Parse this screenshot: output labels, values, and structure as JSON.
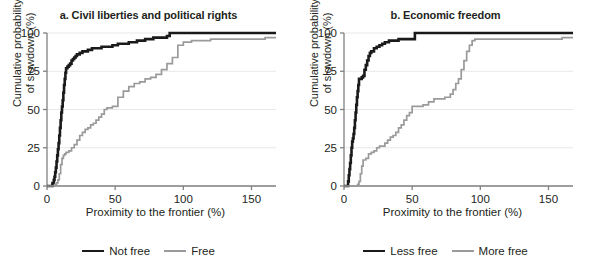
{
  "figure": {
    "width": 594,
    "height": 265,
    "background": "#ffffff"
  },
  "colors": {
    "dark_series": "#1a1a1a",
    "light_series": "#9a9a9a",
    "axis": "#808080",
    "grid": "#e8e8e8",
    "text": "#231f20"
  },
  "panels": [
    {
      "id": "panel-a",
      "title": "a. Civil liberties and political rights",
      "xlabel": "Proximity to the frontier (%)",
      "ylabel_line1": "Cumulative probability",
      "ylabel_line2": "of slowdown (%)",
      "legend": [
        {
          "label": "Not free",
          "color": "#1a1a1a",
          "style": "dark"
        },
        {
          "label": "Free",
          "color": "#9a9a9a",
          "style": "gray"
        }
      ]
    },
    {
      "id": "panel-b",
      "title": "b. Economic freedom",
      "xlabel": "Proximity to the frontier (%)",
      "ylabel_line1": "Cumulative probability",
      "ylabel_line2": "of slowdown (%)",
      "legend": [
        {
          "label": "Less free",
          "color": "#1a1a1a",
          "style": "dark"
        },
        {
          "label": "More free",
          "color": "#9a9a9a",
          "style": "gray"
        }
      ]
    }
  ],
  "chart_data": [
    {
      "type": "line",
      "id": "panel-a",
      "title": "a. Civil liberties and political rights",
      "xlabel": "Proximity to the frontier (%)",
      "ylabel": "Cumulative probability of slowdown (%)",
      "xlim": [
        0,
        168
      ],
      "ylim": [
        0,
        100
      ],
      "xticks": [
        0,
        50,
        100,
        150
      ],
      "xtick_labels": [
        "0",
        "50",
        "100",
        "150"
      ],
      "yticks": [
        0,
        25,
        50,
        75,
        100
      ],
      "ytick_labels": [
        "0",
        "25",
        "50",
        "75",
        "100"
      ],
      "grid": "horizontal",
      "legend_position": "bottom",
      "step": "post",
      "series": [
        {
          "name": "Not free",
          "color": "#1a1a1a",
          "x": [
            3.5,
            4,
            5,
            5.5,
            6,
            6.5,
            7,
            7.5,
            8,
            8.5,
            9,
            9.5,
            10,
            10.5,
            11,
            11.5,
            12,
            12.5,
            13,
            13.5,
            14,
            15,
            16,
            17,
            18,
            19,
            20,
            21,
            22,
            24,
            26,
            28,
            30,
            33,
            36,
            40,
            44,
            48,
            52,
            56,
            60,
            66,
            72,
            78,
            84,
            88,
            90,
            120,
            160
          ],
          "y": [
            0,
            2,
            4,
            6,
            9,
            12,
            16,
            20,
            24,
            28,
            33,
            38,
            43,
            48,
            52,
            56,
            61,
            66,
            70,
            74,
            77,
            78,
            79,
            80,
            82,
            83,
            84,
            85,
            86,
            87,
            88,
            88,
            89,
            90,
            90,
            91,
            91,
            92,
            93,
            93,
            94,
            95,
            96,
            97,
            97,
            98,
            100,
            100,
            100
          ]
        },
        {
          "name": "Free",
          "color": "#9a9a9a",
          "x": [
            5,
            6,
            7,
            8,
            9,
            10,
            11,
            12,
            13,
            14,
            16,
            18,
            20,
            22,
            24,
            26,
            28,
            30,
            32,
            34,
            36,
            38,
            40,
            42,
            44,
            46,
            48,
            52,
            56,
            60,
            64,
            68,
            72,
            76,
            80,
            84,
            88,
            92,
            96,
            100,
            106,
            112,
            120,
            130,
            140,
            150,
            158,
            160
          ],
          "y": [
            0,
            1,
            2,
            4,
            8,
            14,
            18,
            20,
            21,
            22,
            23,
            25,
            27,
            30,
            33,
            35,
            37,
            38,
            40,
            41,
            43,
            45,
            47,
            50,
            51,
            51,
            52,
            58,
            62,
            65,
            67,
            68,
            70,
            71,
            73,
            76,
            80,
            84,
            92,
            94,
            95,
            95,
            96,
            96,
            96,
            96,
            96,
            97
          ]
        }
      ]
    },
    {
      "type": "line",
      "id": "panel-b",
      "title": "b. Economic freedom",
      "xlabel": "Proximity to the frontier (%)",
      "ylabel": "Cumulative probability of slowdown (%)",
      "xlim": [
        0,
        168
      ],
      "ylim": [
        0,
        100
      ],
      "xticks": [
        0,
        50,
        100,
        150
      ],
      "xtick_labels": [
        "0",
        "50",
        "100",
        "150"
      ],
      "yticks": [
        0,
        25,
        50,
        75,
        100
      ],
      "ytick_labels": [
        "0",
        "25",
        "50",
        "75",
        "100"
      ],
      "grid": "horizontal",
      "legend_position": "bottom",
      "step": "post",
      "series": [
        {
          "name": "Less free",
          "color": "#1a1a1a",
          "x": [
            2.5,
            3,
            3.5,
            4,
            4.5,
            5,
            5.5,
            6,
            6.5,
            7,
            7.5,
            8,
            8.5,
            9,
            9.5,
            10,
            10.5,
            11,
            12,
            13,
            14,
            15,
            16,
            17,
            18,
            19,
            20,
            22,
            24,
            26,
            28,
            30,
            33,
            36,
            40,
            44,
            48,
            51,
            52,
            90,
            130,
            160
          ],
          "y": [
            0,
            3,
            7,
            11,
            15,
            20,
            25,
            29,
            31,
            34,
            38,
            43,
            48,
            53,
            58,
            62,
            66,
            70,
            70,
            71,
            72,
            76,
            79,
            82,
            85,
            87,
            88,
            90,
            91,
            92,
            93,
            94,
            95,
            95,
            96,
            96,
            96,
            96,
            100,
            100,
            100,
            100
          ]
        },
        {
          "name": "More free",
          "color": "#9a9a9a",
          "x": [
            9,
            10,
            11,
            12,
            13,
            14,
            16,
            18,
            20,
            22,
            24,
            26,
            28,
            30,
            32,
            34,
            36,
            38,
            40,
            42,
            44,
            46,
            48,
            50,
            54,
            58,
            62,
            66,
            70,
            74,
            78,
            80,
            82,
            84,
            86,
            88,
            90,
            92,
            94,
            96,
            100,
            110,
            120,
            140,
            158,
            160
          ],
          "y": [
            0,
            1,
            3,
            8,
            13,
            17,
            18,
            21,
            22,
            23,
            25,
            26,
            26,
            28,
            30,
            32,
            33,
            35,
            38,
            40,
            43,
            46,
            48,
            52,
            52,
            53,
            55,
            57,
            57,
            58,
            60,
            63,
            67,
            70,
            76,
            82,
            88,
            92,
            95,
            96,
            96,
            96,
            96,
            96,
            96,
            97
          ]
        }
      ]
    }
  ]
}
